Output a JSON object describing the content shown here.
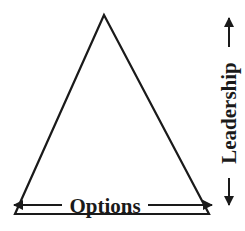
{
  "diagram": {
    "shape": "triangle",
    "stroke_color": "#1a1a1a",
    "horizontal_axis": {
      "label": "Options",
      "direction": "bidirectional"
    },
    "vertical_axis": {
      "label": "Leadership",
      "direction": "bidirectional"
    }
  }
}
